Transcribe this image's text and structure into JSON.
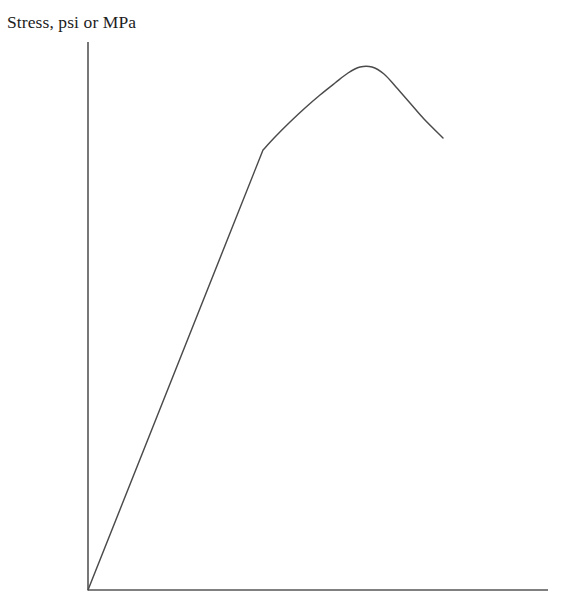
{
  "figure": {
    "background_color": "#ffffff",
    "width": 565,
    "height": 607,
    "y_axis_label": "Stress, psi or MPa",
    "axis_color": "#565656",
    "curve_color": "#4b4b4b",
    "text_color": "#1d1d1d"
  },
  "chart_data": {
    "type": "line",
    "title": "",
    "ylabel": "Stress, psi or MPa",
    "xlabel": "",
    "grid": false,
    "legend": null,
    "xlim": [
      0,
      1
    ],
    "ylim": [
      0,
      1
    ],
    "axis_ticks": {
      "x": [],
      "y": []
    },
    "annotations": [],
    "series": [
      {
        "name": "Stress-strain curve",
        "description": "Engineering stress-strain curve: linear elastic region from the origin to the yield point, followed by strain hardening to the ultimate tensile strength, then necking down to fracture.",
        "points_px": [
          [
            88,
            590
          ],
          [
            263,
            150
          ],
          [
            275,
            137
          ],
          [
            290,
            122
          ],
          [
            305,
            108
          ],
          [
            320,
            95
          ],
          [
            335,
            83
          ],
          [
            348,
            73
          ],
          [
            360,
            67
          ],
          [
            372,
            67
          ],
          [
            384,
            74
          ],
          [
            396,
            87
          ],
          [
            410,
            103
          ],
          [
            424,
            119
          ],
          [
            443,
            138
          ]
        ],
        "key_points": [
          {
            "name": "origin",
            "x_px": 88,
            "y_px": 590
          },
          {
            "name": "yield-point",
            "x_px": 263,
            "y_px": 150
          },
          {
            "name": "ultimate-tensile-strength-peak",
            "x_px": 360,
            "y_px": 66
          },
          {
            "name": "fracture-point",
            "x_px": 443,
            "y_px": 138
          }
        ]
      }
    ],
    "axes_geometry": {
      "origin_px": [
        88,
        590
      ],
      "y_axis_top_px": [
        88,
        42
      ],
      "x_axis_right_px": [
        548,
        590
      ]
    }
  }
}
